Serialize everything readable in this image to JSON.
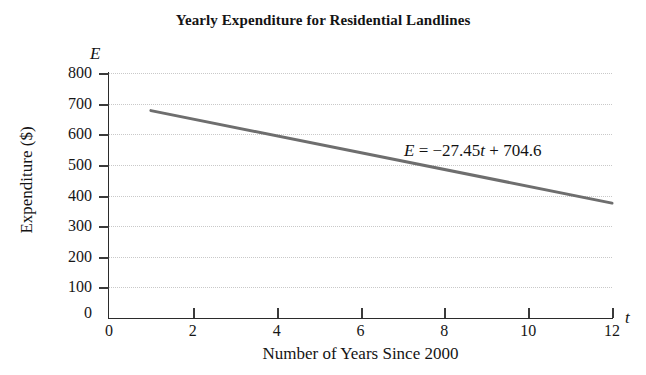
{
  "chart_data": {
    "type": "line",
    "title": "Yearly Expenditure for Residential Landlines",
    "xlabel": "Number of Years Since 2000",
    "ylabel": "Expenditure ($)",
    "x_axis_symbol": "t",
    "y_axis_symbol": "E",
    "xlim": [
      0,
      12
    ],
    "ylim": [
      0,
      800
    ],
    "x_ticks": [
      0,
      2,
      4,
      6,
      8,
      10,
      12
    ],
    "y_ticks": [
      0,
      100,
      200,
      300,
      400,
      500,
      600,
      700,
      800
    ],
    "x_tick_labels": [
      "0",
      "2",
      "4",
      "6",
      "8",
      "10",
      "12"
    ],
    "y_tick_labels": [
      "0",
      "100",
      "200",
      "300",
      "400",
      "500",
      "600",
      "700",
      "800"
    ],
    "grid": true,
    "grid_axis": "y",
    "legend": "none",
    "annotation": "E = −27.45t + 704.6",
    "annotation_parts": {
      "lhs": "E",
      "equals": "=",
      "slope": "−27.45",
      "slope_var": "t",
      "plus": "+",
      "intercept": "704.6"
    },
    "series": [
      {
        "name": "E = -27.45t + 704.6",
        "color": "#6e6e6e",
        "line_width": 3,
        "x": [
          1,
          12
        ],
        "y": [
          677.15,
          375.2
        ],
        "points": [
          {
            "t": 1,
            "E": 677.15
          },
          {
            "t": 2,
            "E": 649.7
          },
          {
            "t": 3,
            "E": 622.25
          },
          {
            "t": 4,
            "E": 594.8
          },
          {
            "t": 5,
            "E": 567.35
          },
          {
            "t": 6,
            "E": 539.9
          },
          {
            "t": 7,
            "E": 512.45
          },
          {
            "t": 8,
            "E": 485.0
          },
          {
            "t": 9,
            "E": 457.55
          },
          {
            "t": 10,
            "E": 430.1
          },
          {
            "t": 11,
            "E": 402.65
          },
          {
            "t": 12,
            "E": 375.2
          }
        ]
      }
    ],
    "colors": {
      "line": "#6e6e6e",
      "axis": "#2b2b2b",
      "grid": "#c9c9c9",
      "text": "#141414",
      "background": "#ffffff"
    }
  }
}
